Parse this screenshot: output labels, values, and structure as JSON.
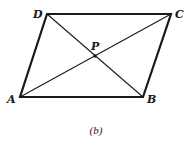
{
  "figure": {
    "caption": "(b)",
    "shape": "parallelogram",
    "colors": {
      "stroke": "#1a1a1a",
      "background": "#ffffff"
    },
    "vertices": [
      {
        "id": "A",
        "label": "A",
        "x": 20,
        "y": 97,
        "label_x": 7,
        "label_y": 103
      },
      {
        "id": "B",
        "label": "B",
        "x": 143,
        "y": 97,
        "label_x": 147,
        "label_y": 103
      },
      {
        "id": "C",
        "label": "C",
        "x": 171,
        "y": 14,
        "label_x": 175,
        "label_y": 18
      },
      {
        "id": "D",
        "label": "D",
        "x": 47,
        "y": 14,
        "label_x": 33,
        "label_y": 18
      }
    ],
    "intersection": {
      "id": "P",
      "label": "P",
      "x": 95,
      "y": 56,
      "label_x": 91,
      "label_y": 50
    },
    "sides": [
      "AB",
      "BC",
      "CD",
      "DA"
    ],
    "diagonals": [
      "AC",
      "BD"
    ]
  }
}
